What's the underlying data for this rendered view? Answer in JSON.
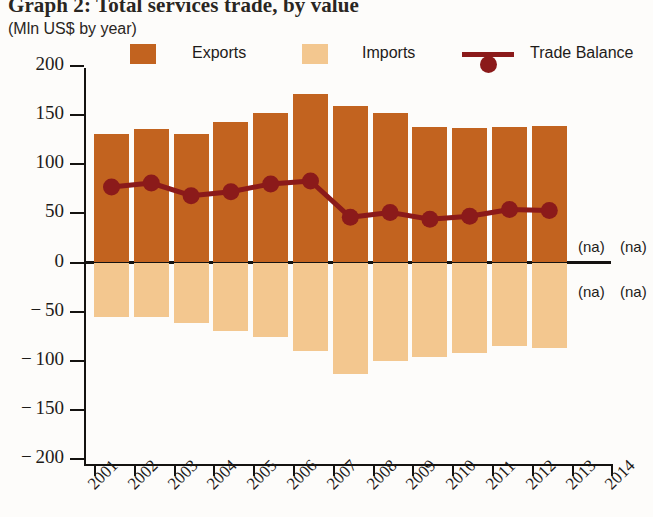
{
  "title": "Graph 2: Total services trade, by value",
  "subtitle": "(Mln US$ by year)",
  "legend": [
    {
      "label": "Exports",
      "type": "swatch",
      "color": "#c2631f"
    },
    {
      "label": "Imports",
      "type": "swatch",
      "color": "#f3c78f"
    },
    {
      "label": "Trade Balance",
      "type": "line-marker",
      "color": "#8b1a1a"
    }
  ],
  "na_marks": [
    {
      "text": "(na)",
      "x": 578,
      "y": 238
    },
    {
      "text": "(na)",
      "x": 620,
      "y": 238
    },
    {
      "text": "(na)",
      "x": 578,
      "y": 283
    },
    {
      "text": "(na)",
      "x": 620,
      "y": 283
    }
  ],
  "chart_data": {
    "type": "bar",
    "title": "Graph 2: Total services trade, by value",
    "subtitle": "(Mln US$ by year)",
    "xlabel": "",
    "ylabel": "Mln US$",
    "ylim": [
      -200,
      200
    ],
    "yticks": [
      200,
      150,
      100,
      50,
      0,
      -50,
      -100,
      -150,
      -200
    ],
    "ytick_labels": [
      "200",
      "150",
      "100",
      "50",
      "0",
      "− 50",
      "− 100",
      "− 150",
      "− 200"
    ],
    "grid": false,
    "legend_position": "top",
    "categories": [
      "2001",
      "2002",
      "2003",
      "2004",
      "2005",
      "2006",
      "2007",
      "2008",
      "2009",
      "2010",
      "2011",
      "2012",
      "2013",
      "2014"
    ],
    "series": [
      {
        "name": "Exports",
        "type": "bar",
        "color": "#c2631f",
        "values": [
          131,
          136,
          131,
          143,
          152,
          172,
          159,
          152,
          138,
          137,
          138,
          139,
          null,
          null
        ],
        "missing_label": "(na)"
      },
      {
        "name": "Imports",
        "type": "bar",
        "color": "#f3c78f",
        "values": [
          -56,
          -55,
          -62,
          -70,
          -76,
          -90,
          -114,
          -100,
          -96,
          -92,
          -85,
          -87,
          null,
          null
        ],
        "missing_label": "(na)"
      },
      {
        "name": "Trade Balance",
        "type": "line",
        "color": "#8b1a1a",
        "values": [
          77,
          81,
          68,
          72,
          80,
          83,
          46,
          51,
          44,
          47,
          54,
          53,
          null,
          null
        ],
        "missing_label": "(na)"
      }
    ]
  }
}
